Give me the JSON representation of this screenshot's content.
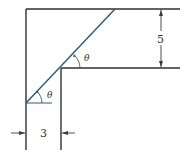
{
  "diagram": {
    "colors": {
      "wall": "#2f2f2f",
      "ladder": "#2a5a78",
      "dimension": "#3a3a3a",
      "background": "#ffffff"
    },
    "labels": {
      "height_dimension": "5",
      "width_dimension": "3",
      "angle_lower": "θ",
      "angle_upper": "θ"
    }
  }
}
